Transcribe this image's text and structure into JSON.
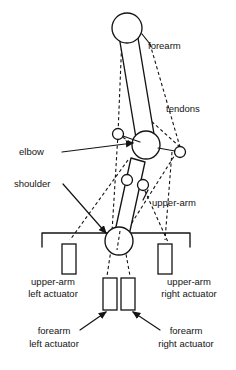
{
  "figure": {
    "background_color": "#ffffff",
    "ink_color": "#141414",
    "width": 236,
    "height": 370
  },
  "labels": {
    "forearm": "forearm",
    "tendons": "tendons",
    "elbow": "elbow",
    "shoulder": "shoulder",
    "upper_arm": "upper-arm",
    "upper_arm_left_actuator_line1": "upper-arm",
    "upper_arm_left_actuator_line2": "left actuator",
    "upper_arm_right_actuator_line1": "upper-arm",
    "upper_arm_right_actuator_line2": "right actuator",
    "forearm_left_actuator_line1": "forearm",
    "forearm_left_actuator_line2": "left actuator",
    "forearm_right_actuator_line1": "forearm",
    "forearm_right_actuator_line2": "right actuator"
  },
  "parts": {
    "forearm_link": "forearm-link",
    "upper_arm_link": "upper-arm-link",
    "elbow_joint": "elbow-joint",
    "shoulder_joint": "shoulder-joint",
    "elbow_pulley_left": "elbow-pulley-left",
    "elbow_pulley_right": "elbow-pulley-right",
    "upper_arm_pulley_left": "upper-arm-pulley-left",
    "upper_arm_pulley_right": "upper-arm-pulley-right",
    "forearm_tip": "forearm-tip",
    "base_bracket": "base-bracket"
  },
  "actuators": [
    {
      "id": "upper-arm-left-actuator",
      "x": 62,
      "y": 244,
      "w": 14,
      "h": 30
    },
    {
      "id": "upper-arm-right-actuator",
      "x": 158,
      "y": 244,
      "w": 14,
      "h": 30
    },
    {
      "id": "forearm-left-actuator",
      "x": 103,
      "y": 278,
      "w": 14,
      "h": 32
    },
    {
      "id": "forearm-right-actuator",
      "x": 121,
      "y": 278,
      "w": 14,
      "h": 32
    }
  ]
}
